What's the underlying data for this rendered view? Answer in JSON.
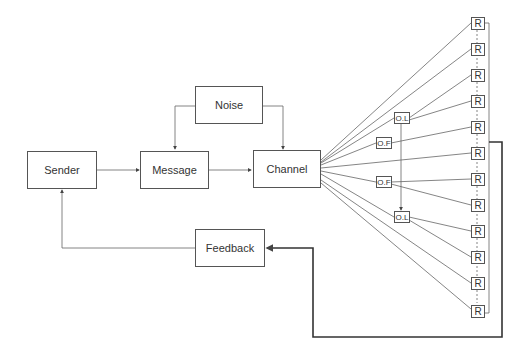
{
  "diagram": {
    "nodes": {
      "sender": "Sender",
      "message": "Message",
      "noise": "Noise",
      "channel": "Channel",
      "feedback": "Feedback",
      "opinion_leader": "O.L",
      "opinion_follower": "O.F",
      "receiver": "R"
    },
    "receivers_count": 12,
    "colors": {
      "line": "#555555",
      "thick_line": "#333333",
      "text": "#333333"
    }
  }
}
